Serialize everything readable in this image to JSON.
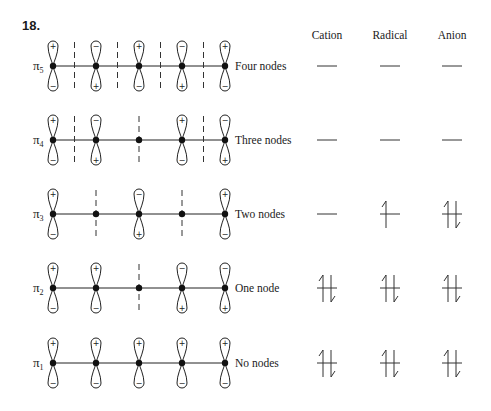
{
  "problem_number": "18.",
  "columns": [
    "Cation",
    "Radical",
    "Anion"
  ],
  "rows": [
    {
      "label": "π",
      "subscript": "5",
      "description": "Four nodes",
      "top_phases": [
        "+",
        "−",
        "+",
        "−",
        "+"
      ],
      "bottom_phases": [
        "−",
        "+",
        "−",
        "+",
        "−"
      ],
      "node_positions_atom_index": [
        0.5,
        1.5,
        2.5,
        3.5
      ],
      "electrons": [
        0,
        0,
        0
      ]
    },
    {
      "label": "π",
      "subscript": "4",
      "description": "Three nodes",
      "top_phases": [
        "+",
        "−",
        null,
        "+",
        "−"
      ],
      "bottom_phases": [
        "−",
        "+",
        null,
        "−",
        "+"
      ],
      "node_positions_atom_index": [
        0.5,
        2,
        3.5
      ],
      "electrons": [
        0,
        0,
        0
      ]
    },
    {
      "label": "π",
      "subscript": "3",
      "description": "Two nodes",
      "top_phases": [
        "+",
        null,
        "−",
        null,
        "+"
      ],
      "bottom_phases": [
        "−",
        null,
        "+",
        null,
        "−"
      ],
      "node_positions_atom_index": [
        1,
        3
      ],
      "electrons": [
        0,
        1,
        2
      ]
    },
    {
      "label": "π",
      "subscript": "2",
      "description": "One node",
      "top_phases": [
        "+",
        "+",
        null,
        "−",
        "−"
      ],
      "bottom_phases": [
        "−",
        "−",
        null,
        "+",
        "+"
      ],
      "node_positions_atom_index": [
        2
      ],
      "electrons": [
        2,
        2,
        2
      ]
    },
    {
      "label": "π",
      "subscript": "1",
      "description": "No nodes",
      "top_phases": [
        "+",
        "+",
        "+",
        "+",
        "+"
      ],
      "bottom_phases": [
        "−",
        "−",
        "−",
        "−",
        "−"
      ],
      "node_positions_atom_index": [],
      "electrons": [
        2,
        2,
        2
      ]
    }
  ]
}
